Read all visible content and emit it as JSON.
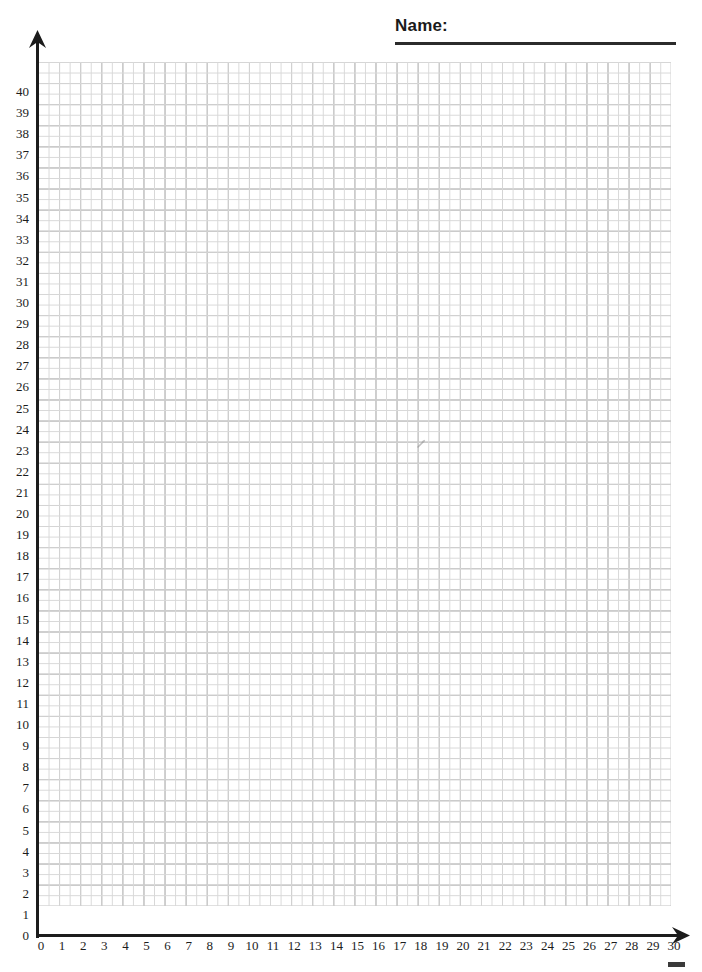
{
  "header": {
    "name_label": "Name:",
    "name_value": "",
    "rule_color": "#2b2b2b"
  },
  "axes": {
    "x_axis_name": "x-axis",
    "y_axis_name": "y-axis",
    "axis_color": "#1c1c1c",
    "x_arrow_icon": "arrow-right-icon",
    "y_arrow_icon": "arrow-up-icon"
  },
  "grid": {
    "major_line_color": "#8a8a8a",
    "minor_line_color": "#d8d8d8",
    "background_color": "#ffffff",
    "minor_divisions_per_unit": 2
  },
  "chart_data": {
    "type": "scatter",
    "title": "",
    "subtitle": "",
    "xlabel": "",
    "ylabel": "",
    "xlim": [
      0,
      30
    ],
    "ylim": [
      0,
      40
    ],
    "x_tick_step": 1,
    "y_tick_step": 1,
    "grid": true,
    "legend": null,
    "legend_position": "none",
    "annotations": [],
    "series": [
      {
        "name": "empty",
        "x": [],
        "y": [],
        "values": []
      }
    ],
    "x_tick_labels": [
      "0",
      "1",
      "2",
      "3",
      "4",
      "5",
      "6",
      "7",
      "8",
      "9",
      "10",
      "11",
      "12",
      "13",
      "14",
      "15",
      "16",
      "17",
      "18",
      "19",
      "20",
      "21",
      "22",
      "23",
      "24",
      "25",
      "26",
      "27",
      "28",
      "29",
      "30"
    ],
    "y_tick_labels": [
      "0",
      "1",
      "2",
      "3",
      "4",
      "5",
      "6",
      "7",
      "8",
      "9",
      "10",
      "11",
      "12",
      "13",
      "14",
      "15",
      "16",
      "17",
      "18",
      "19",
      "20",
      "21",
      "22",
      "23",
      "24",
      "25",
      "26",
      "27",
      "28",
      "29",
      "30",
      "31",
      "32",
      "33",
      "34",
      "35",
      "36",
      "37",
      "38",
      "39",
      "40"
    ]
  }
}
